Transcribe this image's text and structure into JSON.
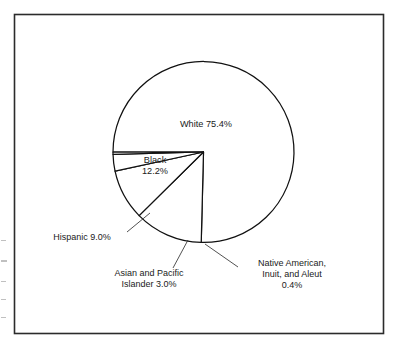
{
  "figure": {
    "name": "race-ethnicity-pie-chart",
    "frame_color": "#2b2b2b",
    "background": "#ffffff",
    "stroke_color": "#111111"
  },
  "chart_data": {
    "type": "pie",
    "title": "",
    "subtitle": "",
    "xlabel": "",
    "ylabel": "",
    "legend": "none",
    "grid": false,
    "units": "percent",
    "total": 100.0,
    "categories": [
      "White",
      "Black",
      "Hispanic",
      "Asian and Pacific Islander",
      "Native American, Inuit, and Aleut"
    ],
    "values": [
      75.4,
      12.2,
      9.0,
      3.0,
      0.4
    ],
    "slices": [
      {
        "name": "White",
        "label_lines": [
          "White 75.4%"
        ],
        "value": 75.4,
        "value_text": "75.4%",
        "label_kind": "inside",
        "label_x": 206,
        "label_y": 125,
        "start_angle": 180.0,
        "sweep_angle": 271.44
      },
      {
        "name": "Black",
        "label_lines": [
          "Black",
          "12.2%"
        ],
        "value": 12.2,
        "value_text": "12.2%",
        "label_kind": "inside",
        "label_x": 155,
        "label_y": 166,
        "start_angle": 91.44,
        "sweep_angle": 43.92
      },
      {
        "name": "Hispanic",
        "label_lines": [
          "Hispanic 9.0%"
        ],
        "value": 9.0,
        "value_text": "9.0%",
        "label_kind": "callout",
        "label_x": 82,
        "label_y": 238,
        "leader_from_x": 127,
        "leader_from_y": 232,
        "leader_to_x": 150,
        "leader_to_y": 213,
        "start_angle": 135.36,
        "sweep_angle": 32.4
      },
      {
        "name": "Asian and Pacific Islander",
        "label_lines": [
          "Asian and Pacific",
          "Islander 3.0%"
        ],
        "value": 3.0,
        "value_text": "3.0%",
        "label_kind": "callout",
        "label_x": 149,
        "label_y": 279,
        "leader_from_x": 173,
        "leader_from_y": 268,
        "leader_to_x": 188,
        "leader_to_y": 240,
        "start_angle": 167.76,
        "sweep_angle": 10.8
      },
      {
        "name": "Native American, Inuit, and Aleut",
        "label_lines": [
          "Native American,",
          "Inuit, and Aleut",
          "0.4%"
        ],
        "value": 0.4,
        "value_text": "0.4%",
        "label_kind": "callout",
        "label_x": 292,
        "label_y": 275,
        "leader_from_x": 238,
        "leader_from_y": 267,
        "leader_to_x": 205,
        "leader_to_y": 244,
        "start_angle": 178.56,
        "sweep_angle": 1.44
      }
    ],
    "geometry": {
      "center_x": 203.5,
      "center_y": 152,
      "radius": 90.5
    }
  }
}
